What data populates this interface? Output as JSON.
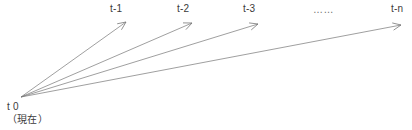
{
  "diagram": {
    "background_color": "#ffffff",
    "line_color": "#767676",
    "text_color": "#3a3a3a",
    "origin": {
      "label": "t 0",
      "sublabel": "（現在）",
      "x": 21,
      "y": 97
    },
    "ellipsis": {
      "text": "……",
      "x": 313,
      "y": 4
    },
    "arrows": [
      {
        "label": "t-1",
        "label_x": 110,
        "label_y": 3,
        "from_x": 21,
        "from_y": 97,
        "to_x": 126,
        "to_y": 22
      },
      {
        "label": "t-2",
        "label_x": 177,
        "label_y": 3,
        "from_x": 21,
        "from_y": 97,
        "to_x": 192,
        "to_y": 23
      },
      {
        "label": "t-3",
        "label_x": 243,
        "label_y": 3,
        "from_x": 21,
        "from_y": 97,
        "to_x": 258,
        "to_y": 24
      },
      {
        "label": "t-n",
        "label_x": 391,
        "label_y": 3,
        "from_x": 21,
        "from_y": 97,
        "to_x": 401,
        "to_y": 25
      }
    ]
  }
}
